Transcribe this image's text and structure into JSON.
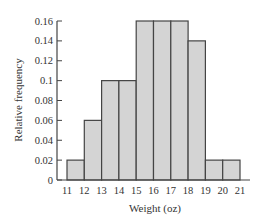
{
  "chart_data": {
    "type": "bar",
    "subtype": "histogram",
    "title": "",
    "xlabel": "Weight (oz)",
    "ylabel": "Relative frequency",
    "bin_edges": [
      11,
      12,
      13,
      14,
      15,
      16,
      17,
      18,
      19,
      20,
      21
    ],
    "categories": [
      "11-12",
      "12-13",
      "13-14",
      "14-15",
      "15-16",
      "16-17",
      "17-18",
      "18-19",
      "19-20",
      "20-21"
    ],
    "values": [
      0.02,
      0.06,
      0.1,
      0.1,
      0.16,
      0.16,
      0.16,
      0.14,
      0.02,
      0.02
    ],
    "xticks": [
      "11",
      "12",
      "13",
      "14",
      "15",
      "16",
      "17",
      "18",
      "19",
      "20",
      "21"
    ],
    "yticks": [
      "0",
      "0.02",
      "0.04",
      "0.06",
      "0.08",
      "0.1",
      "0.12",
      "0.14",
      "0.16"
    ],
    "ylim": [
      0,
      0.16
    ],
    "xlim": [
      11,
      21
    ],
    "grid": false,
    "legend": null,
    "bar_color": "#d4d4d4",
    "edge_color": "#444444"
  }
}
